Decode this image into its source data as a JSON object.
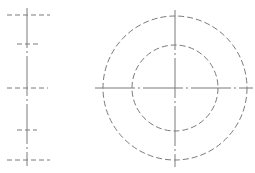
{
  "drawing": {
    "type": "technical-drawing",
    "line_color": "#7a7a7a",
    "background": "#ffffff",
    "side_view": {
      "axis_x": 27,
      "axis_y_range": [
        8,
        166
      ],
      "hidden_lines": [
        {
          "y": 15,
          "x1": 7,
          "x2": 50
        },
        {
          "y": 44,
          "x1": 17,
          "x2": 38
        },
        {
          "y": 88,
          "x1": 7,
          "x2": 48
        },
        {
          "y": 130,
          "x1": 17,
          "x2": 37
        },
        {
          "y": 160,
          "x1": 7,
          "x2": 50
        }
      ]
    },
    "front_view": {
      "center": [
        175,
        88
      ],
      "outer_radius": 72,
      "inner_radius": 43,
      "h_axis": [
        95,
        253
      ],
      "v_axis": [
        10,
        167
      ]
    }
  }
}
